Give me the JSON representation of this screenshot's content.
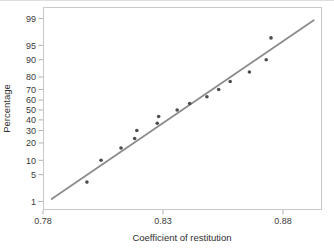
{
  "chart_data": {
    "type": "scatter",
    "plot_kind": "normal-probability-plot",
    "title": "",
    "xlabel": "Coefficient of restitution",
    "ylabel": "Percentage",
    "x_ticks": [
      {
        "value": 0.78,
        "label": "0.78"
      },
      {
        "value": 0.83,
        "label": "0.83"
      },
      {
        "value": 0.88,
        "label": "0.88"
      }
    ],
    "y_ticks_percent": [
      99,
      95,
      90,
      80,
      70,
      60,
      50,
      40,
      30,
      20,
      10,
      5,
      1
    ],
    "xlim": [
      0.78,
      0.8963
    ],
    "ylim_percent": [
      0.5,
      99.5
    ],
    "y_scale": "probit",
    "grid": "off",
    "legend": "none",
    "points": [
      {
        "x": 0.7983,
        "percent": 3.33
      },
      {
        "x": 0.8042,
        "percent": 10
      },
      {
        "x": 0.8125,
        "percent": 16.67
      },
      {
        "x": 0.8182,
        "percent": 23.33
      },
      {
        "x": 0.8191,
        "percent": 30
      },
      {
        "x": 0.8276,
        "percent": 36.67
      },
      {
        "x": 0.8282,
        "percent": 43.33
      },
      {
        "x": 0.8359,
        "percent": 50
      },
      {
        "x": 0.8411,
        "percent": 56.67
      },
      {
        "x": 0.8483,
        "percent": 63.33
      },
      {
        "x": 0.8532,
        "percent": 70
      },
      {
        "x": 0.858,
        "percent": 76.67
      },
      {
        "x": 0.866,
        "percent": 83.33
      },
      {
        "x": 0.873,
        "percent": 90
      },
      {
        "x": 0.875,
        "percent": 96.67
      }
    ],
    "fit_line": {
      "x_start": 0.7836,
      "x_end": 0.8928,
      "mean": 0.838,
      "sd": 0.024
    },
    "style": {
      "point_color": "#4d4d4d",
      "line_color": "#8c8c8c",
      "box_color": "#c9c9c9",
      "tick_color": "#b2b2b2",
      "tick_label_color": "#3a3a3a",
      "axis_label_color": "#2e2e2e",
      "background": "#ffffff",
      "top_rule_color": "#dedede"
    }
  }
}
